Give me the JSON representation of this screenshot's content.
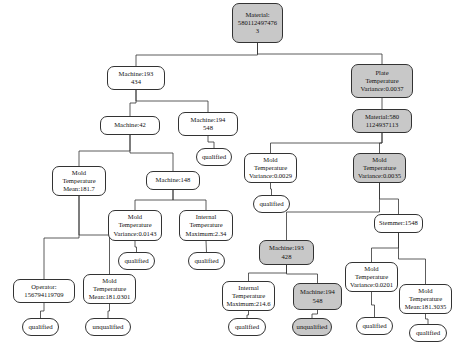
{
  "diagram": {
    "type": "decision-tree",
    "highlight_color": "#c8c8c8",
    "node_fill": "#ffffff",
    "line_color": "#333333",
    "nodes": [
      {
        "id": "n0",
        "label": "Material:\n580112497476\n3",
        "highlighted": true,
        "x": 232,
        "y": 3,
        "w": 51,
        "h": 40
      },
      {
        "id": "n1",
        "label": "Machine:193\n434",
        "highlighted": false,
        "x": 107,
        "y": 66,
        "w": 58,
        "h": 24
      },
      {
        "id": "n2",
        "label": "Plate\nTemperature\nVariance:0.0037",
        "highlighted": true,
        "x": 351,
        "y": 64,
        "w": 62,
        "h": 34
      },
      {
        "id": "n3",
        "label": "Material:580\n1124937113",
        "highlighted": true,
        "x": 352,
        "y": 109,
        "w": 60,
        "h": 24
      },
      {
        "id": "n4",
        "label": "Machine:42",
        "highlighted": false,
        "x": 100,
        "y": 116,
        "w": 60,
        "h": 19
      },
      {
        "id": "n5",
        "label": "Machine:194\n548",
        "highlighted": false,
        "x": 178,
        "y": 112,
        "w": 60,
        "h": 24
      },
      {
        "id": "n6",
        "label": "qualified",
        "highlighted": false,
        "leaf": true,
        "x": 196,
        "y": 148,
        "w": 36,
        "h": 18
      },
      {
        "id": "n7",
        "label": "Mold\nTemperature\nMean:181.7",
        "highlighted": false,
        "x": 52,
        "y": 166,
        "w": 54,
        "h": 30
      },
      {
        "id": "n8",
        "label": "Machine:148",
        "highlighted": false,
        "x": 146,
        "y": 171,
        "w": 54,
        "h": 19
      },
      {
        "id": "n9",
        "label": "Mold\nTemperature\nVariance:0.0029",
        "highlighted": false,
        "x": 244,
        "y": 153,
        "w": 53,
        "h": 30
      },
      {
        "id": "n10",
        "label": "Mold\nTemperature\nVariance:0.0035",
        "highlighted": true,
        "x": 353,
        "y": 153,
        "w": 53,
        "h": 30
      },
      {
        "id": "n11",
        "label": "qualified",
        "highlighted": false,
        "leaf": true,
        "x": 253,
        "y": 195,
        "w": 37,
        "h": 18
      },
      {
        "id": "n12",
        "label": "Mold\nTemperature\nVariance:0.0143",
        "highlighted": false,
        "x": 108,
        "y": 210,
        "w": 54,
        "h": 31
      },
      {
        "id": "n13",
        "label": "Internal\nTemperature\nMaximum:2.34",
        "highlighted": false,
        "x": 179,
        "y": 210,
        "w": 54,
        "h": 31
      },
      {
        "id": "n14",
        "label": "Stemmer:1548",
        "highlighted": false,
        "x": 374,
        "y": 214,
        "w": 49,
        "h": 19
      },
      {
        "id": "n15",
        "label": "qualified",
        "highlighted": false,
        "leaf": true,
        "x": 118,
        "y": 252,
        "w": 37,
        "h": 18
      },
      {
        "id": "n16",
        "label": "qualified",
        "highlighted": false,
        "leaf": true,
        "x": 188,
        "y": 252,
        "w": 37,
        "h": 18
      },
      {
        "id": "n17",
        "label": "Machine:193\n428",
        "highlighted": true,
        "x": 259,
        "y": 240,
        "w": 55,
        "h": 25
      },
      {
        "id": "n18",
        "label": "Mold\nTemperature\nVariance:0.0201",
        "highlighted": false,
        "x": 345,
        "y": 262,
        "w": 53,
        "h": 30
      },
      {
        "id": "n19",
        "label": "Operator:\n156794119709",
        "highlighted": false,
        "x": 13,
        "y": 279,
        "w": 62,
        "h": 24
      },
      {
        "id": "n20",
        "label": "Mold\nTemperature\nMean:181.0301",
        "highlighted": false,
        "x": 83,
        "y": 274,
        "w": 53,
        "h": 30
      },
      {
        "id": "n21",
        "label": "Internal\nTemperature\nMaximum:214.6",
        "highlighted": false,
        "x": 222,
        "y": 281,
        "w": 53,
        "h": 30
      },
      {
        "id": "n22",
        "label": "Machine:194\n548",
        "highlighted": true,
        "x": 293,
        "y": 283,
        "w": 49,
        "h": 27
      },
      {
        "id": "n23",
        "label": "Mold\nTemperature\nMean:181.3035",
        "highlighted": false,
        "x": 399,
        "y": 284,
        "w": 53,
        "h": 30
      },
      {
        "id": "n24",
        "label": "qualified",
        "highlighted": false,
        "leaf": true,
        "x": 22,
        "y": 318,
        "w": 37,
        "h": 18
      },
      {
        "id": "n25",
        "label": "unqualified",
        "highlighted": false,
        "leaf": true,
        "x": 85,
        "y": 318,
        "w": 46,
        "h": 18
      },
      {
        "id": "n26",
        "label": "qualified",
        "highlighted": false,
        "leaf": true,
        "x": 228,
        "y": 318,
        "w": 38,
        "h": 18
      },
      {
        "id": "n27",
        "label": "unqualified",
        "highlighted": true,
        "leaf": true,
        "x": 292,
        "y": 318,
        "w": 40,
        "h": 18
      },
      {
        "id": "n28",
        "label": "qualified",
        "highlighted": false,
        "leaf": true,
        "x": 356,
        "y": 317,
        "w": 37,
        "h": 18
      },
      {
        "id": "n29",
        "label": "qualified",
        "highlighted": false,
        "leaf": true,
        "x": 409,
        "y": 324,
        "w": 38,
        "h": 18
      }
    ],
    "edges": [
      [
        "n0",
        "n1"
      ],
      [
        "n0",
        "n2"
      ],
      [
        "n2",
        "n3"
      ],
      [
        "n1",
        "n4"
      ],
      [
        "n1",
        "n5"
      ],
      [
        "n5",
        "n6"
      ],
      [
        "n4",
        "n7"
      ],
      [
        "n4",
        "n8"
      ],
      [
        "n3",
        "n9"
      ],
      [
        "n3",
        "n10"
      ],
      [
        "n9",
        "n11"
      ],
      [
        "n8",
        "n12"
      ],
      [
        "n8",
        "n13"
      ],
      [
        "n12",
        "n15"
      ],
      [
        "n13",
        "n16"
      ],
      [
        "n10",
        "n17"
      ],
      [
        "n10",
        "n14"
      ],
      [
        "n7",
        "n19"
      ],
      [
        "n7",
        "n20"
      ],
      [
        "n17",
        "n21"
      ],
      [
        "n17",
        "n22"
      ],
      [
        "n14",
        "n18"
      ],
      [
        "n14",
        "n23"
      ],
      [
        "n19",
        "n24"
      ],
      [
        "n20",
        "n25"
      ],
      [
        "n21",
        "n26"
      ],
      [
        "n22",
        "n27"
      ],
      [
        "n18",
        "n28"
      ],
      [
        "n23",
        "n29"
      ]
    ]
  }
}
